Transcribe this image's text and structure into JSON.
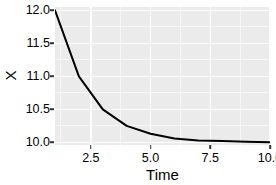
{
  "chart_data": {
    "type": "line",
    "title": "",
    "subtitle": "",
    "xlabel": "Time",
    "ylabel": "X",
    "xlim": [
      1,
      10
    ],
    "ylim": [
      9.96,
      12.05
    ],
    "grid": true,
    "legend": null,
    "x_ticks": [
      2.5,
      5.0,
      7.5,
      10.0
    ],
    "x_tick_labels": [
      "2.5",
      "5.0",
      "7.5",
      "10.0"
    ],
    "x_minor_ticks": [
      1.25,
      3.75,
      6.25,
      8.75
    ],
    "y_ticks": [
      10.0,
      10.5,
      11.0,
      11.5,
      12.0
    ],
    "y_tick_labels": [
      "10.0",
      "10.5",
      "11.0",
      "11.5",
      "12.0"
    ],
    "y_minor_ticks": [
      10.25,
      10.75,
      11.25,
      11.75
    ],
    "series": [
      {
        "name": "X",
        "color": "#000000",
        "line_width": 2.0,
        "x": [
          1,
          2,
          3,
          4,
          5,
          6,
          7,
          8,
          9,
          10
        ],
        "values": [
          12.0,
          11.0,
          10.5,
          10.25,
          10.13,
          10.06,
          10.03,
          10.02,
          10.01,
          10.0
        ]
      }
    ],
    "panel_background": "#ebebeb",
    "gridline_major_color": "#ffffff",
    "gridline_minor_color": "#f7f7f7",
    "plot_background": "#ffffff"
  },
  "axes": {
    "y_title": "X",
    "x_title": "Time",
    "y_labels": [
      "12.0",
      "11.5",
      "11.0",
      "10.5",
      "10.0"
    ],
    "x_labels": [
      "2.5",
      "5.0",
      "7.5",
      "10.0"
    ]
  }
}
